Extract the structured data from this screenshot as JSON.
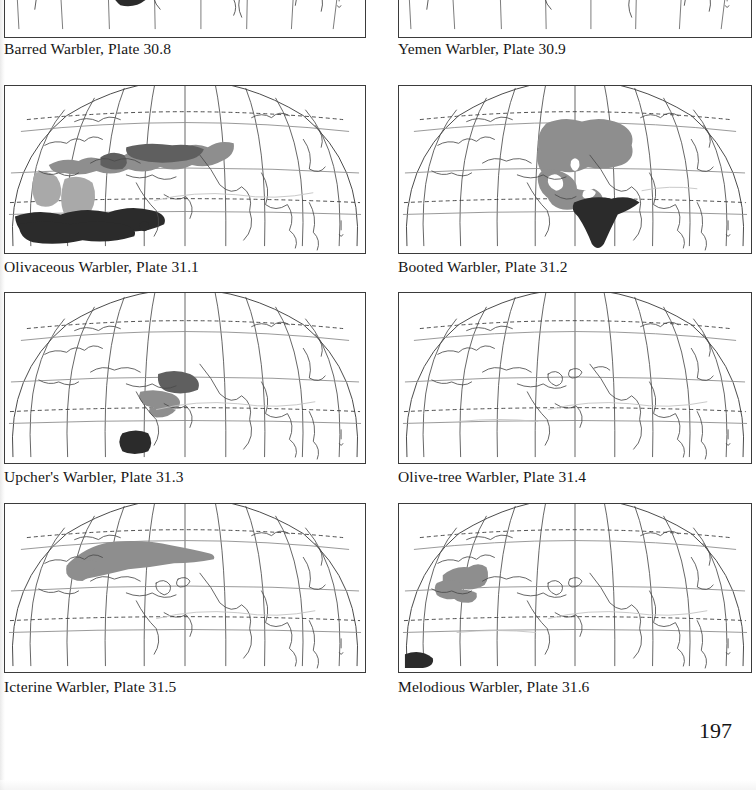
{
  "page": {
    "number": "197",
    "background_color": "#ffffff",
    "text_color": "#161616"
  },
  "style_colors": {
    "frame_border": "#3b3b3b",
    "graticule": "#5a5a5a",
    "coastline": "#4a4a4a",
    "tropic_dashed": "#3a3a3a",
    "faint_boundary": "#b9b9b9",
    "range_dark": "#2b2b2b",
    "range_gray": "#8e8e8e",
    "range_light_gray": "#a9a9a9"
  },
  "legend_semantics": {
    "dark_fill": "winter / non-breeding range",
    "gray_fill": "breeding range"
  },
  "maps": [
    {
      "id": "barred-warbler",
      "species": "Barred Warbler",
      "plate": "Plate 30.8",
      "caption": "Barred Warbler, Plate 30.8",
      "cropped": true,
      "column": "left",
      "row": 0,
      "ranges": [
        {
          "type": "dark_fill",
          "region": "eastern Africa / Horn of Africa wintering blob"
        }
      ]
    },
    {
      "id": "yemen-warbler",
      "species": "Yemen Warbler",
      "plate": "Plate 30.9",
      "caption": "Yemen Warbler, Plate 30.9",
      "cropped": true,
      "column": "right",
      "row": 0,
      "ranges": []
    },
    {
      "id": "olivaceous-warbler",
      "species": "Olivaceous Warbler",
      "plate": "Plate 31.1",
      "caption": "Olivaceous Warbler, Plate 31.1",
      "cropped": false,
      "column": "left",
      "row": 1,
      "ranges": [
        {
          "type": "gray_fill",
          "region": "Mediterranean, Middle East and Central Asia breeding belt"
        },
        {
          "type": "dark_fill",
          "region": "Sahel / sub-Saharan Africa wintering band"
        }
      ]
    },
    {
      "id": "booted-warbler",
      "species": "Booted Warbler",
      "plate": "Plate 31.2",
      "caption": "Booted Warbler, Plate 31.2",
      "cropped": false,
      "column": "right",
      "row": 1,
      "ranges": [
        {
          "type": "gray_fill",
          "region": "Central Asia / Russia breeding range"
        },
        {
          "type": "dark_fill",
          "region": "Indian subcontinent wintering range"
        }
      ]
    },
    {
      "id": "upchers-warbler",
      "species": "Upcher's Warbler",
      "plate": "Plate 31.3",
      "caption": "Upcher's Warbler, Plate 31.3",
      "cropped": false,
      "column": "left",
      "row": 2,
      "ranges": [
        {
          "type": "gray_fill",
          "region": "Iran / Central Asia breeding range"
        },
        {
          "type": "dark_fill",
          "region": "East Africa wintering range"
        }
      ]
    },
    {
      "id": "olive-tree-warbler",
      "species": "Olive-tree Warbler",
      "plate": "Plate 31.4",
      "caption": "Olive-tree Warbler, Plate 31.4",
      "cropped": false,
      "column": "right",
      "row": 2,
      "ranges": []
    },
    {
      "id": "icterine-warbler",
      "species": "Icterine Warbler",
      "plate": "Plate 31.5",
      "caption": "Icterine Warbler, Plate 31.5",
      "cropped": false,
      "column": "left",
      "row": 3,
      "ranges": [
        {
          "type": "gray_fill",
          "region": "northern and eastern Europe into western Siberia breeding range"
        }
      ]
    },
    {
      "id": "melodious-warbler",
      "species": "Melodious Warbler",
      "plate": "Plate 31.6",
      "caption": "Melodious Warbler, Plate 31.6",
      "cropped": false,
      "column": "right",
      "row": 3,
      "ranges": [
        {
          "type": "gray_fill",
          "region": "Iberia, France and north-west Africa breeding range"
        },
        {
          "type": "dark_fill",
          "region": "West Africa wintering corner"
        }
      ]
    }
  ]
}
